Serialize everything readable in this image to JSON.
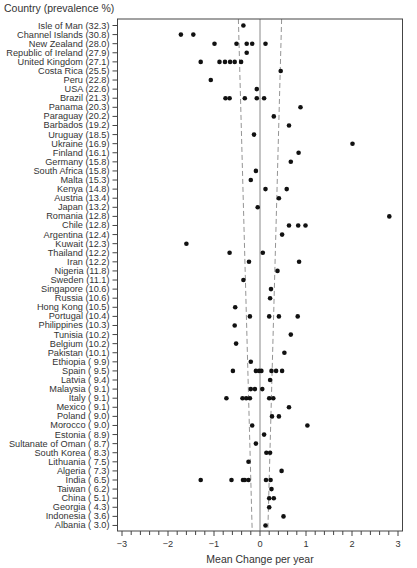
{
  "chart_data": {
    "type": "scatter",
    "title": "",
    "ylabel": "Country (prevalence %)",
    "xlabel": "Mean Change per year",
    "xlim": [
      -3.1,
      3.1
    ],
    "x_ticks": [
      -3,
      -2,
      -1,
      0,
      1,
      2,
      3
    ],
    "x_tick_labels": [
      "−3",
      "−2",
      "−1",
      "0",
      "1",
      "2",
      "3"
    ],
    "minor_tick_step": 0.2,
    "grid": false,
    "reference_lines": {
      "center": 0,
      "funnel_upper_top": 0.47,
      "funnel_upper_bottom": 0.17,
      "funnel_lower_top": -0.47,
      "funnel_lower_bottom": -0.17
    },
    "categories": [
      {
        "country": "Isle of Man",
        "prevalence": "32.3",
        "values": [
          -0.36
        ]
      },
      {
        "country": "Channel Islands",
        "prevalence": "30.8",
        "values": [
          -1.72,
          -1.45
        ]
      },
      {
        "country": "New Zealand",
        "prevalence": "28.0",
        "values": [
          -0.99,
          -0.51,
          -0.29,
          -0.17,
          0.12
        ]
      },
      {
        "country": "Republic of Ireland",
        "prevalence": "27.9",
        "values": [
          -0.29
        ]
      },
      {
        "country": "United Kingdom",
        "prevalence": "27.1",
        "values": [
          -1.29,
          -0.88,
          -0.76,
          -0.65,
          -0.55,
          -0.41
        ]
      },
      {
        "country": "Costa Rica",
        "prevalence": "25.5",
        "values": [
          0.45
        ]
      },
      {
        "country": "Peru",
        "prevalence": "22.8",
        "values": [
          -1.07
        ]
      },
      {
        "country": "USA",
        "prevalence": "22.6",
        "values": [
          -0.07
        ]
      },
      {
        "country": "Brazil",
        "prevalence": "21.3",
        "values": [
          -0.75,
          -0.66,
          -0.33,
          -0.07,
          0.09
        ]
      },
      {
        "country": "Panama",
        "prevalence": "20.3",
        "values": [
          0.88
        ]
      },
      {
        "country": "Paraguay",
        "prevalence": "20.2",
        "values": [
          0.3
        ]
      },
      {
        "country": "Barbados",
        "prevalence": "19.2",
        "values": [
          0.63
        ]
      },
      {
        "country": "Uruguay",
        "prevalence": "18.5",
        "values": [
          -0.13
        ]
      },
      {
        "country": "Ukraine",
        "prevalence": "16.9",
        "values": [
          2.01
        ]
      },
      {
        "country": "Finland",
        "prevalence": "16.1",
        "values": [
          0.84
        ]
      },
      {
        "country": "Germany",
        "prevalence": "15.8",
        "values": [
          0.67
        ]
      },
      {
        "country": "South Africa",
        "prevalence": "15.8",
        "values": [
          -0.09
        ]
      },
      {
        "country": "Malta",
        "prevalence": "15.3",
        "values": [
          -0.2
        ]
      },
      {
        "country": "Kenya",
        "prevalence": "14.8",
        "values": [
          0.12,
          0.58
        ]
      },
      {
        "country": "Austria",
        "prevalence": "13.4",
        "values": [
          0.41
        ]
      },
      {
        "country": "Japan",
        "prevalence": "13.2",
        "values": [
          -0.05
        ]
      },
      {
        "country": "Romania",
        "prevalence": "12.8",
        "values": [
          2.81
        ]
      },
      {
        "country": "Chile",
        "prevalence": "12.8",
        "values": [
          0.63,
          0.83,
          0.99
        ]
      },
      {
        "country": "Argentina",
        "prevalence": "12.4",
        "values": [
          0.48
        ]
      },
      {
        "country": "Kuwait",
        "prevalence": "12.3",
        "values": [
          -1.6
        ]
      },
      {
        "country": "Thailand",
        "prevalence": "12.2",
        "values": [
          -0.66,
          0.06
        ]
      },
      {
        "country": "Iran",
        "prevalence": "12.2",
        "values": [
          -0.24,
          0.85
        ]
      },
      {
        "country": "Nigeria",
        "prevalence": "11.8",
        "values": [
          0.38
        ]
      },
      {
        "country": "Sweden",
        "prevalence": "11.1",
        "values": [
          -0.36
        ]
      },
      {
        "country": "Singapore",
        "prevalence": "10.6",
        "values": [
          0.24
        ]
      },
      {
        "country": "Russia",
        "prevalence": "10.6",
        "values": [
          0.22
        ]
      },
      {
        "country": "Hong Kong",
        "prevalence": "10.5",
        "values": [
          -0.54
        ]
      },
      {
        "country": "Portugal",
        "prevalence": "10.4",
        "values": [
          -0.22,
          0.2,
          0.41,
          0.82
        ]
      },
      {
        "country": "Philippines",
        "prevalence": "10.3",
        "values": [
          -0.55
        ]
      },
      {
        "country": "Tunisia",
        "prevalence": "10.2",
        "values": [
          0.67
        ]
      },
      {
        "country": "Belgium",
        "prevalence": "10.2",
        "values": [
          -0.52
        ]
      },
      {
        "country": "Pakistan",
        "prevalence": "10.1",
        "values": [
          0.53
        ]
      },
      {
        "country": "Ethiopia",
        "prevalence": "9.9",
        "values": [
          -0.2
        ]
      },
      {
        "country": "Spain",
        "prevalence": "9.5",
        "values": [
          -0.59,
          -0.09,
          -0.02,
          0.03,
          0.25,
          0.35,
          0.48
        ]
      },
      {
        "country": "Latvia",
        "prevalence": "9.4",
        "values": [
          0.22
        ]
      },
      {
        "country": "Malaysia",
        "prevalence": "9.1",
        "values": [
          -0.2,
          -0.11,
          0.05
        ]
      },
      {
        "country": "Italy",
        "prevalence": "9.1",
        "values": [
          -0.73,
          -0.38,
          -0.3,
          -0.22,
          0.2,
          0.29
        ]
      },
      {
        "country": "Mexico",
        "prevalence": "9.1",
        "values": [
          0.63
        ]
      },
      {
        "country": "Poland",
        "prevalence": "9.0",
        "values": [
          0.26,
          0.41
        ]
      },
      {
        "country": "Morocco",
        "prevalence": "9.0",
        "values": [
          -0.17,
          1.03
        ]
      },
      {
        "country": "Estonia",
        "prevalence": "8.9",
        "values": [
          0.09
        ]
      },
      {
        "country": "Sultanate of Oman",
        "prevalence": "8.7",
        "values": [
          -0.09
        ]
      },
      {
        "country": "South Korea",
        "prevalence": "8.3",
        "values": [
          0.14,
          0.22
        ]
      },
      {
        "country": "Lithuania",
        "prevalence": "7.5",
        "values": [
          -0.25
        ]
      },
      {
        "country": "Algeria",
        "prevalence": "7.3",
        "values": [
          0.47
        ]
      },
      {
        "country": "India",
        "prevalence": "6.5",
        "values": [
          -1.29,
          -0.62,
          -0.37,
          -0.33,
          -0.25,
          0.13,
          0.23
        ]
      },
      {
        "country": "Taiwan",
        "prevalence": "6.2",
        "values": [
          0.25
        ]
      },
      {
        "country": "China",
        "prevalence": "5.1",
        "values": [
          0.2,
          0.3
        ]
      },
      {
        "country": "Georgia",
        "prevalence": "4.3",
        "values": [
          0.2
        ]
      },
      {
        "country": "Indonesia",
        "prevalence": "3.6",
        "values": [
          0.51
        ]
      },
      {
        "country": "Albania",
        "prevalence": "3.0",
        "values": [
          0.12
        ]
      }
    ],
    "colors": {
      "dot": "#111111",
      "axis": "#444444",
      "text": "#333333",
      "ref_line": "#777777"
    }
  }
}
